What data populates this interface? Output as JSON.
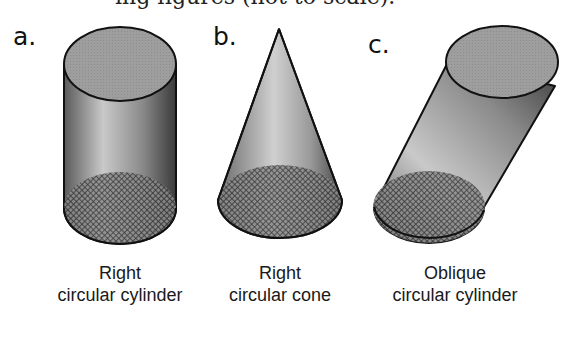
{
  "top_text_clipped": "ing figures (not to scale).",
  "figures": [
    {
      "letter": "a.",
      "caption_line1": "Right",
      "caption_line2": "circular cylinder",
      "shape": "right-circular-cylinder"
    },
    {
      "letter": "b.",
      "caption_line1": "Right",
      "caption_line2": "circular cone",
      "shape": "right-circular-cone"
    },
    {
      "letter": "c.",
      "caption_line1": "Oblique",
      "caption_line2": "circular cylinder",
      "shape": "oblique-circular-cylinder"
    }
  ],
  "colors": {
    "top_face": "#9a9a9a",
    "outline": "#111111",
    "base_hatch": "#333333"
  }
}
